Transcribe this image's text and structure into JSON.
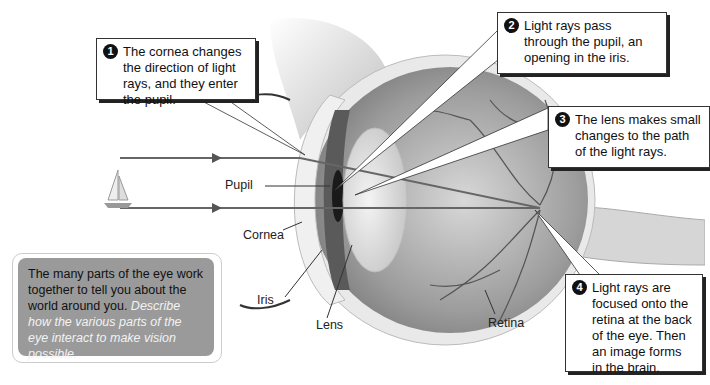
{
  "diagram": {
    "labels": {
      "pupil": "Pupil",
      "cornea": "Cornea",
      "iris": "Iris",
      "lens": "Lens",
      "retina": "Retina"
    },
    "callouts": [
      {
        "number": "1",
        "text": "The cornea changes the direction of light rays, and they enter the pupil."
      },
      {
        "number": "2",
        "text": "Light rays pass through the pupil, an opening in the iris."
      },
      {
        "number": "3",
        "text": "The lens makes small changes to the path of the light rays."
      },
      {
        "number": "4",
        "text": "Light rays are focused onto the retina at the back of the eye. Then an image forms in the brain."
      }
    ],
    "note": {
      "text": "The many parts of the eye work together to tell you about the world around you.",
      "prompt": "Describe how the various parts of the eye interact to make vision possible."
    },
    "object_icon": "sailboat-icon",
    "colors": {
      "ray": "#666666",
      "note_bg": "#9a9a9a",
      "callout_num_bg": "#111111"
    }
  }
}
